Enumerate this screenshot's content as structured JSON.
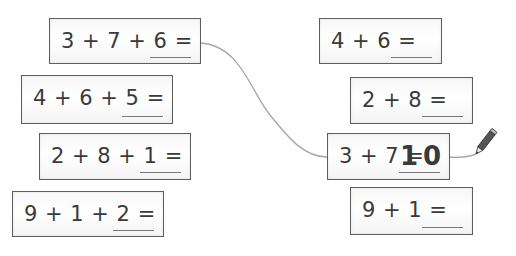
{
  "worksheet": {
    "left_column": [
      {
        "expression": "3 + 7 + 6 =",
        "answer": ""
      },
      {
        "expression": "4 + 6 + 5 =",
        "answer": ""
      },
      {
        "expression": "2 + 8 + 1 =",
        "answer": ""
      },
      {
        "expression": "9 + 1 + 2 =",
        "answer": ""
      }
    ],
    "right_column": [
      {
        "expression": "4 + 6 =",
        "answer": ""
      },
      {
        "expression": "2 + 8 =",
        "answer": ""
      },
      {
        "expression": "3 + 7 =",
        "answer": "10"
      },
      {
        "expression": "9 + 1 =",
        "answer": ""
      }
    ],
    "connection": {
      "from": "3 + 7 + 6 =",
      "to": "3 + 7 ="
    },
    "icons": [
      "pencil-icon"
    ],
    "colors": {
      "card_border": "#5e5e5e",
      "text": "#3a3a3a",
      "connector_line": "#a8a8a8",
      "pencil_body": "#555555"
    }
  }
}
